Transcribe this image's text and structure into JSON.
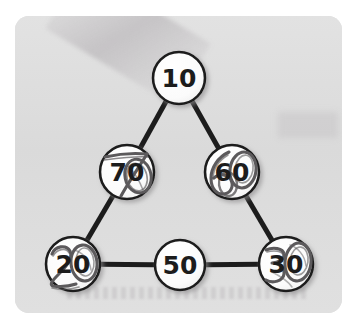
{
  "worksheet": {
    "panel_background": "#dcdcdc",
    "page_background": "#ffffff",
    "edge_color": "#1c1c1c",
    "node_fill": "#fdfdfd",
    "printed_ink": "#1c1c1c",
    "pencil_ink": "#5c5a5c"
  },
  "diagram": {
    "type": "triangle-number-puzzle",
    "shape": "triangle",
    "nodes": [
      {
        "id": "top",
        "label": "10",
        "entry": "printed",
        "cx": 179,
        "cy": 78,
        "r": 26
      },
      {
        "id": "mid-left",
        "label": "70",
        "entry": "handwritten",
        "cx": 127,
        "cy": 172,
        "r": 27
      },
      {
        "id": "mid-right",
        "label": "60",
        "entry": "handwritten",
        "cx": 232,
        "cy": 172,
        "r": 27
      },
      {
        "id": "bottom-left",
        "label": "20",
        "entry": "handwritten",
        "cx": 73,
        "cy": 264,
        "r": 27
      },
      {
        "id": "bottom-middle",
        "label": "50",
        "entry": "printed",
        "cx": 180,
        "cy": 265,
        "r": 25
      },
      {
        "id": "bottom-right",
        "label": "30",
        "entry": "handwritten",
        "cx": 286,
        "cy": 264,
        "r": 27
      }
    ],
    "edges": [
      {
        "from": "top",
        "to": "mid-left"
      },
      {
        "from": "top",
        "to": "mid-right"
      },
      {
        "from": "mid-left",
        "to": "bottom-left"
      },
      {
        "from": "mid-right",
        "to": "bottom-right"
      },
      {
        "from": "bottom-left",
        "to": "bottom-middle"
      },
      {
        "from": "bottom-middle",
        "to": "bottom-right"
      }
    ],
    "edge_width": 5
  }
}
